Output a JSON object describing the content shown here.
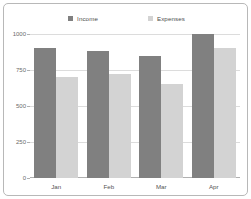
{
  "chart_data": {
    "type": "bar",
    "title": "",
    "subtitle": "",
    "xlabel": "",
    "ylabel": "",
    "categories": [
      "Jan",
      "Feb",
      "Mar",
      "Apr"
    ],
    "series": [
      {
        "name": "Income",
        "color": "#808080",
        "values": [
          900,
          880,
          850,
          1000
        ]
      },
      {
        "name": "Expenses",
        "color": "#d3d3d3",
        "values": [
          700,
          720,
          650,
          900
        ]
      }
    ],
    "ylim": [
      0,
      1000
    ],
    "yticks": [
      0,
      250,
      500,
      750,
      1000
    ],
    "ytick_labels": [
      "0",
      "250",
      "500",
      "750",
      "1000"
    ],
    "grid": true,
    "legend_position": "top-center"
  },
  "legend": {
    "items": [
      {
        "label": "Income",
        "swatch": "legend-swatch-income"
      },
      {
        "label": "Expenses",
        "swatch": "legend-swatch-expenses"
      }
    ]
  },
  "colors": {
    "income": "#808080",
    "expenses": "#d3d3d3",
    "gridline": "#dcdcdc",
    "axis": "#b0b0b0",
    "frame_border": "#b8b8b8",
    "tick_text": "#6b6b6b",
    "label_text": "#555555",
    "legend_text": "#4d4d4d",
    "background": "#ffffff"
  }
}
